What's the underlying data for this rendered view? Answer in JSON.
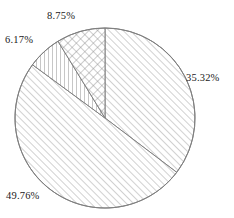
{
  "chart_data": {
    "type": "pie",
    "title": "",
    "xlabel": "",
    "ylabel": "",
    "legend": "none",
    "grid": false,
    "value_suffix": "%",
    "start_angle_deg": 0,
    "direction": "clockwise",
    "center": {
      "x": 105,
      "y": 118
    },
    "radius": 90,
    "categories": [
      "35.32%",
      "49.76%",
      "6.17%",
      "8.75%"
    ],
    "values": [
      35.32,
      49.76,
      6.17,
      8.75
    ],
    "labels": [
      "35.32%",
      "49.76%",
      "6.17%",
      "8.75%"
    ],
    "slices": [
      {
        "label": "35.32%",
        "value": 35.32,
        "pattern": "diagonal-forward-hatch",
        "fill": "#ffffff",
        "stroke": "#808080",
        "start_deg": 0.0,
        "end_deg": 127.15
      },
      {
        "label": "49.76%",
        "value": 49.76,
        "pattern": "diagonal-forward-hatch",
        "fill": "#ffffff",
        "stroke": "#808080",
        "start_deg": 127.15,
        "end_deg": 306.29
      },
      {
        "label": "6.17%",
        "value": 6.17,
        "pattern": "vertical-line-hatch",
        "fill": "#ffffff",
        "stroke": "#808080",
        "start_deg": 306.29,
        "end_deg": 328.5
      },
      {
        "label": "8.75%",
        "value": 8.75,
        "pattern": "cross-hatch",
        "fill": "#ffffff",
        "stroke": "#808080",
        "start_deg": 328.5,
        "end_deg": 360.0
      }
    ],
    "colors": {
      "background": "#ffffff",
      "outline": "#808080",
      "hatch": "#9a9a9a",
      "label_text": "#1a1a1a"
    }
  },
  "labels": {
    "top": "8.75%",
    "upper_left": "6.17%",
    "right": "35.32%",
    "bottom_left": "49.76%"
  }
}
